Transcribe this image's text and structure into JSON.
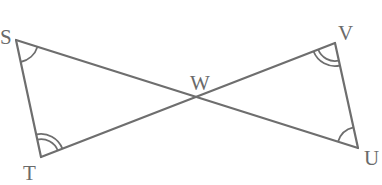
{
  "diagram": {
    "type": "geometry",
    "colors": {
      "line": "#6e6e6e",
      "label": "#6a6a6a",
      "background": "#ffffff"
    },
    "points": {
      "S": {
        "label": "S",
        "x": 16,
        "y": 40
      },
      "T": {
        "label": "T",
        "x": 41,
        "y": 157
      },
      "V": {
        "label": "V",
        "x": 335,
        "y": 43
      },
      "U": {
        "label": "U",
        "x": 358,
        "y": 148
      },
      "W": {
        "label": "W",
        "x": 198,
        "y": 95
      }
    },
    "segments": [
      {
        "from": "S",
        "to": "T"
      },
      {
        "from": "S",
        "to": "U"
      },
      {
        "from": "T",
        "to": "V"
      },
      {
        "from": "V",
        "to": "U"
      }
    ],
    "angle_marks": [
      {
        "vertex": "S",
        "arcs": 1
      },
      {
        "vertex": "T",
        "arcs": 2
      },
      {
        "vertex": "V",
        "arcs": 2
      },
      {
        "vertex": "U",
        "arcs": 1
      }
    ]
  }
}
